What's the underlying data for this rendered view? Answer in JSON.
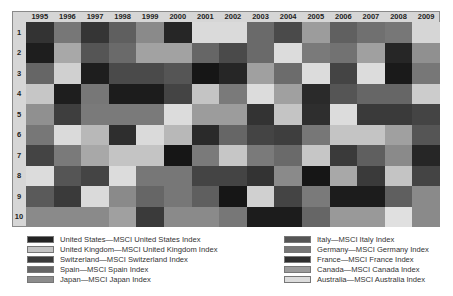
{
  "chart_data": {
    "type": "heatmap",
    "title": "",
    "xlabel": "",
    "ylabel": "",
    "x": [
      "1995",
      "1996",
      "1997",
      "1998",
      "1999",
      "2000",
      "2001",
      "2002",
      "2003",
      "2004",
      "2005",
      "2006",
      "2007",
      "2008",
      "2009"
    ],
    "y": [
      "1",
      "2",
      "3",
      "4",
      "5",
      "6",
      "7",
      "8",
      "9",
      "10"
    ],
    "legend": [
      {
        "name": "United States—MSCI United States Index",
        "color": "#232323"
      },
      {
        "name": "United Kingdom—MSCI United Kingdom Index",
        "color": "#c4c4c4"
      },
      {
        "name": "Switzerland—MSCI Switzerland Index",
        "color": "#3a3a3a"
      },
      {
        "name": "Spain—MSCI Spain Index",
        "color": "#666666"
      },
      {
        "name": "Japan—MSCI Japan Index",
        "color": "#8c8c8c"
      },
      {
        "name": "Italy—MSCI Italy Index",
        "color": "#555555"
      },
      {
        "name": "Germany—MSCI Germany Index",
        "color": "#777777"
      },
      {
        "name": "France—MSCI France Index",
        "color": "#2e2e2e"
      },
      {
        "name": "Canada—MSCI Canada Index",
        "color": "#9c9c9c"
      },
      {
        "name": "Australia—MSCI Australia Index",
        "color": "#dcdcdc"
      }
    ],
    "cells": [
      [
        "#333333",
        "#777777",
        "#353535",
        "#5f5f5f",
        "#8a8a8a",
        "#262626",
        "#dadada",
        "#dadada",
        "#6a6a6a",
        "#4a4a4a",
        "#9c9c9c",
        "#606060",
        "#707070",
        "#777777",
        "#d6d6d6"
      ],
      [
        "#1e1e1e",
        "#a8a8a8",
        "#555555",
        "#6a6a6a",
        "#a2a2a2",
        "#a2a2a2",
        "#666666",
        "#4a4a4a",
        "#6a6a6a",
        "#dcdcdc",
        "#7a7a7a",
        "#727272",
        "#a0a0a0",
        "#262626",
        "#909090"
      ],
      [
        "#666666",
        "#d0d0d0",
        "#1e1e1e",
        "#4a4a4a",
        "#4a4a4a",
        "#555555",
        "#161616",
        "#262626",
        "#a0a0a0",
        "#6c6c6c",
        "#dcdcdc",
        "#444444",
        "#dcdcdc",
        "#1a1a1a",
        "#777777"
      ],
      [
        "#c6c6c6",
        "#1e1e1e",
        "#777777",
        "#1c1c1c",
        "#1c1c1c",
        "#444444",
        "#c4c4c4",
        "#7a7a7a",
        "#dcdcdc",
        "#a0a0a0",
        "#2a2a2a",
        "#555555",
        "#666666",
        "#666666",
        "#cccccc"
      ],
      [
        "#909090",
        "#3e3e3e",
        "#7a7a7a",
        "#7a7a7a",
        "#7a7a7a",
        "#dcdcdc",
        "#9c9c9c",
        "#9c9c9c",
        "#333333",
        "#c4c4c4",
        "#2e2e2e",
        "#dcdcdc",
        "#3a3a3a",
        "#3a3a3a",
        "#444444"
      ],
      [
        "#777777",
        "#dadada",
        "#b8b8b8",
        "#2e2e2e",
        "#dadada",
        "#b8b8b8",
        "#2a2a2a",
        "#666666",
        "#444444",
        "#3e3e3e",
        "#777777",
        "#c4c4c4",
        "#c4c4c4",
        "#a0a0a0",
        "#555555"
      ],
      [
        "#444444",
        "#7a7a7a",
        "#a8a8a8",
        "#c4c4c4",
        "#c4c4c4",
        "#161616",
        "#7a7a7a",
        "#c6c6c6",
        "#7a7a7a",
        "#6a6a6a",
        "#c6c6c6",
        "#3a3a3a",
        "#5f5f5f",
        "#8a8a8a",
        "#262626"
      ],
      [
        "#dcdcdc",
        "#555555",
        "#444444",
        "#dcdcdc",
        "#777777",
        "#777777",
        "#444444",
        "#444444",
        "#333333",
        "#8a8a8a",
        "#161616",
        "#a8a8a8",
        "#3a3a3a",
        "#c4c4c4",
        "#444444"
      ],
      [
        "#5a5a5a",
        "#3a3a3a",
        "#dadada",
        "#8a8a8a",
        "#666666",
        "#777777",
        "#5f5f5f",
        "#161616",
        "#d0d0d0",
        "#444444",
        "#7a7a7a",
        "#1c1c1c",
        "#1c1c1c",
        "#5f5f5f",
        "#8a8a8a"
      ],
      [
        "#8a8a8a",
        "#8a8a8a",
        "#8a8a8a",
        "#a0a0a0",
        "#3a3a3a",
        "#8a8a8a",
        "#8a8a8a",
        "#777777",
        "#1c1c1c",
        "#1c1c1c",
        "#666666",
        "#999999",
        "#999999",
        "#e0e0e0",
        "#8a8a8a"
      ]
    ]
  }
}
